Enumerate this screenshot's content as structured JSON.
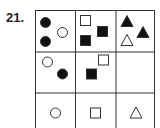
{
  "question_number": "21.",
  "grid": {
    "rows": 3,
    "cols": 3,
    "cells": [
      [
        {
          "shapes": [
            {
              "type": "circle",
              "fill": "black",
              "x": 10,
              "y": 12
            },
            {
              "type": "circle",
              "fill": "black",
              "x": 10,
              "y": 31
            },
            {
              "type": "circle",
              "fill": "white",
              "x": 27,
              "y": 22
            }
          ]
        },
        {
          "shapes": [
            {
              "type": "square",
              "fill": "white",
              "x": 10,
              "y": 10
            },
            {
              "type": "square",
              "fill": "black",
              "x": 10,
              "y": 30
            },
            {
              "type": "square",
              "fill": "black",
              "x": 27,
              "y": 21
            }
          ]
        },
        {
          "shapes": [
            {
              "type": "triangle",
              "fill": "black",
              "x": 11,
              "y": 11
            },
            {
              "type": "triangle",
              "fill": "white",
              "x": 11,
              "y": 30
            },
            {
              "type": "triangle",
              "fill": "black",
              "x": 27,
              "y": 22
            }
          ]
        }
      ],
      [
        {
          "shapes": [
            {
              "type": "circle",
              "fill": "white",
              "x": 12,
              "y": 10
            },
            {
              "type": "circle",
              "fill": "black",
              "x": 27,
              "y": 22
            }
          ]
        },
        {
          "shapes": [
            {
              "type": "square",
              "fill": "white",
              "x": 28,
              "y": 8
            },
            {
              "type": "square",
              "fill": "black",
              "x": 16,
              "y": 22
            }
          ]
        },
        {
          "shapes": []
        }
      ],
      [
        {
          "shapes": [
            {
              "type": "circle",
              "fill": "white",
              "x": 20,
              "y": 20
            }
          ]
        },
        {
          "shapes": [
            {
              "type": "square",
              "fill": "white",
              "x": 20,
              "y": 20
            }
          ]
        },
        {
          "shapes": [
            {
              "type": "triangle",
              "fill": "white",
              "x": 20,
              "y": 20
            }
          ]
        }
      ]
    ]
  },
  "colors": {
    "stroke": "#333333",
    "fill_black": "#111111",
    "fill_white": "#ffffff"
  }
}
